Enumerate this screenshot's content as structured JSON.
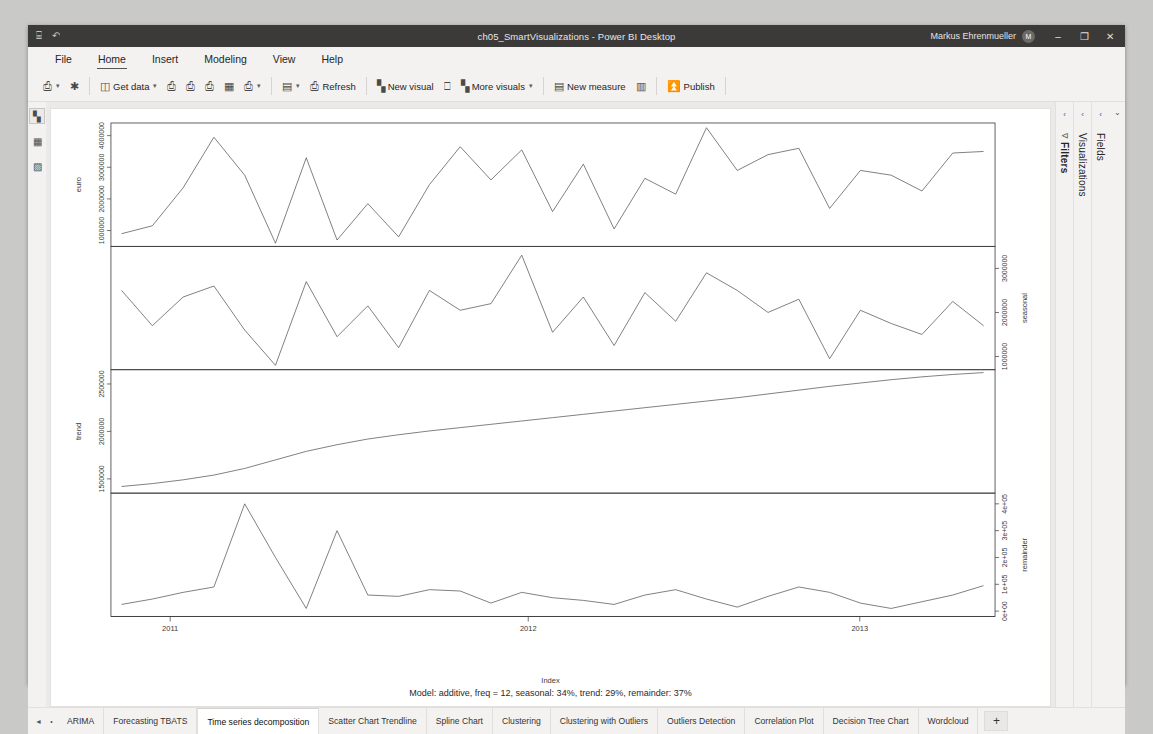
{
  "window": {
    "title": "ch05_SmartVisualizations - Power BI Desktop",
    "user": "Markus Ehrenmueller",
    "avatar_initial": "M",
    "quick_access": [
      {
        "name": "save-icon",
        "glyph": "⌸"
      },
      {
        "name": "undo-icon",
        "glyph": "↶"
      }
    ],
    "controls": [
      {
        "name": "minimize-button",
        "glyph": "–"
      },
      {
        "name": "restore-button",
        "glyph": "❐"
      },
      {
        "name": "close-button",
        "glyph": "✕"
      }
    ]
  },
  "menu": {
    "items": [
      {
        "label": "File",
        "active": false
      },
      {
        "label": "Home",
        "active": true
      },
      {
        "label": "Insert",
        "active": false
      },
      {
        "label": "Modeling",
        "active": false
      },
      {
        "label": "View",
        "active": false
      },
      {
        "label": "Help",
        "active": false
      }
    ]
  },
  "ribbon": {
    "groups": [
      {
        "buttons": [
          {
            "name": "paste-button",
            "icon": "ὌB",
            "glyph": "⎘",
            "label": "",
            "caret": true
          },
          {
            "name": "format-painter-button",
            "glyph": "✂",
            "label": "",
            "caret": false
          }
        ]
      },
      {
        "buttons": [
          {
            "name": "get-data-button",
            "glyph": "὜3",
            "label": "Get data",
            "caret": true
          },
          {
            "name": "excel-workbook-button",
            "glyph": "⎗",
            "label": "",
            "caret": false
          },
          {
            "name": "dataverse-button",
            "glyph": "⎗",
            "label": "",
            "caret": false
          },
          {
            "name": "sql-server-button",
            "glyph": "⎗",
            "label": "",
            "caret": false
          },
          {
            "name": "enter-data-button",
            "glyph": "▦",
            "label": "",
            "caret": false
          },
          {
            "name": "recent-sources-button",
            "glyph": "⎗",
            "label": "",
            "caret": true
          }
        ]
      },
      {
        "buttons": [
          {
            "name": "transform-data-button",
            "glyph": "▤",
            "label": "",
            "caret": true
          },
          {
            "name": "refresh-button",
            "glyph": "⎗",
            "label": "Refresh",
            "caret": false
          }
        ]
      },
      {
        "buttons": [
          {
            "name": "new-visual-button",
            "glyph": "ὌA",
            "label": "New visual",
            "caret": false
          },
          {
            "name": "text-box-button",
            "glyph": "⎕",
            "label": "",
            "caret": false
          },
          {
            "name": "more-visuals-button",
            "glyph": "Ὄ8",
            "label": "More visuals",
            "caret": true
          }
        ]
      },
      {
        "buttons": [
          {
            "name": "new-measure-button",
            "glyph": "▤",
            "label": "New measure",
            "caret": false
          },
          {
            "name": "quick-measure-button",
            "glyph": "▥",
            "label": "",
            "caret": false
          }
        ]
      },
      {
        "buttons": [
          {
            "name": "publish-button",
            "glyph": "⇧",
            "label": "Publish",
            "caret": false
          }
        ]
      }
    ]
  },
  "left_rail": {
    "items": [
      {
        "name": "report-view-icon",
        "glyph": "ὌA",
        "selected": true
      },
      {
        "name": "data-view-icon",
        "glyph": "▦",
        "selected": false
      },
      {
        "name": "model-view-icon",
        "glyph": "▨",
        "selected": false
      }
    ]
  },
  "panes": [
    {
      "name": "filters-pane",
      "label": "Filters",
      "chevron": "‹",
      "icon": "∇",
      "bold": true
    },
    {
      "name": "visualizations-pane",
      "label": "Visualizations",
      "chevron": "‹",
      "icon": "",
      "bold": false
    },
    {
      "name": "fields-pane",
      "label": "Fields",
      "chevron": "‹",
      "icon": "",
      "bold": false
    }
  ],
  "pane_expander": {
    "name": "expand-panes-button",
    "glyph": "⌄"
  },
  "tabs": {
    "prev_label": "◄",
    "overflow_label": "•",
    "add_label": "+",
    "items": [
      {
        "label": "ARIMA",
        "active": false
      },
      {
        "label": "Forecasting TBATS",
        "active": false
      },
      {
        "label": "Time series decomposition",
        "active": true
      },
      {
        "label": "Scatter Chart Trendline",
        "active": false
      },
      {
        "label": "Spline Chart",
        "active": false
      },
      {
        "label": "Clustering",
        "active": false
      },
      {
        "label": "Clustering with Outliers",
        "active": false
      },
      {
        "label": "Outliers Detection",
        "active": false
      },
      {
        "label": "Correlation Plot",
        "active": false
      },
      {
        "label": "Decision Tree Chart",
        "active": false
      },
      {
        "label": "Wordcloud",
        "active": false
      }
    ]
  },
  "chart_data": {
    "type": "line",
    "title": "",
    "subtitle": "Model: additive, freq = 12, seasonal: 34%, trend: 29%, remainder: 37%",
    "xlabel": "Index",
    "grid": false,
    "legend": "none",
    "x_ticks": [
      "2011",
      "2012",
      "2013"
    ],
    "x_tick_positions": [
      0.055,
      0.46,
      0.835
    ],
    "panels": [
      {
        "name": "euro",
        "ylabel": "euro",
        "ylabel_side": "left",
        "y_ticks": [
          "1000000",
          "2000000",
          "3000000",
          "4000000"
        ],
        "ylim": [
          500000,
          4400000
        ],
        "values": [
          900000,
          1150000,
          2350000,
          3950000,
          2750000,
          600000,
          3300000,
          700000,
          1850000,
          800000,
          2450000,
          3650000,
          2600000,
          3550000,
          1600000,
          3100000,
          1050000,
          2650000,
          2150000,
          4250000,
          2900000,
          3400000,
          3600000,
          1700000,
          2900000,
          2750000,
          2250000,
          3450000,
          3500000
        ]
      },
      {
        "name": "seasonal",
        "ylabel": "seasonal",
        "ylabel_side": "right",
        "y_ticks": [
          "1000000",
          "2000000",
          "3000000"
        ],
        "ylim": [
          700000,
          3500000
        ],
        "values": [
          2500000,
          1700000,
          2350000,
          2600000,
          1600000,
          800000,
          2700000,
          1450000,
          2150000,
          1200000,
          2500000,
          2050000,
          2200000,
          3300000,
          1550000,
          2350000,
          1250000,
          2450000,
          1800000,
          2900000,
          2500000,
          2000000,
          2300000,
          950000,
          2050000,
          1750000,
          1500000,
          2250000,
          1700000
        ]
      },
      {
        "name": "trend",
        "ylabel": "trend",
        "ylabel_side": "left",
        "y_ticks": [
          "1500000",
          "2000000",
          "2500000"
        ],
        "ylim": [
          1350000,
          2650000
        ],
        "values": [
          1420000,
          1450000,
          1490000,
          1540000,
          1610000,
          1700000,
          1790000,
          1860000,
          1920000,
          1965000,
          2005000,
          2040000,
          2075000,
          2110000,
          2145000,
          2180000,
          2215000,
          2250000,
          2285000,
          2320000,
          2355000,
          2395000,
          2435000,
          2475000,
          2510000,
          2545000,
          2575000,
          2600000,
          2620000
        ]
      },
      {
        "name": "remainder",
        "ylabel": "remainder",
        "ylabel_side": "right",
        "y_ticks": [
          "0e+00",
          "1e+05",
          "2e+05",
          "3e+05",
          "4e+05"
        ],
        "ylim": [
          -20000,
          440000
        ],
        "values": [
          25000,
          45000,
          70000,
          90000,
          400000,
          200000,
          10000,
          300000,
          60000,
          55000,
          80000,
          75000,
          30000,
          70000,
          50000,
          40000,
          25000,
          60000,
          80000,
          45000,
          15000,
          55000,
          90000,
          70000,
          30000,
          10000,
          35000,
          60000,
          95000
        ]
      }
    ]
  }
}
